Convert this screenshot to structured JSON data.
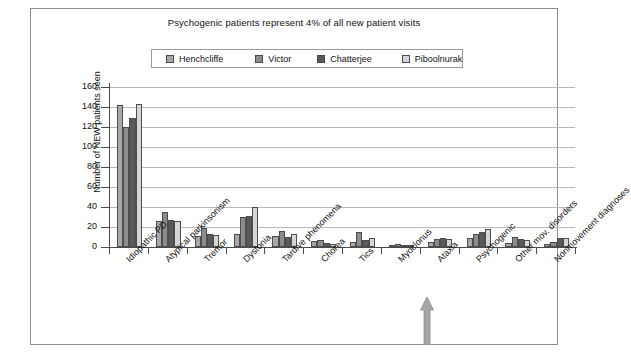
{
  "chart_data": {
    "type": "bar",
    "title": "Psychogenic patients represent 4% of all new patient visits",
    "xlabel": "",
    "ylabel": "Number of NEW patients seen",
    "ylim": [
      0,
      160
    ],
    "yticks": [
      0,
      20,
      40,
      60,
      80,
      100,
      120,
      140,
      160
    ],
    "grid": true,
    "legend_position": "top-center",
    "categories": [
      "Idiopathic PD",
      "Atypical parkinsonism",
      "Tremor",
      "Dystonia",
      "Tardive phenomena",
      "Chorea",
      "Tics",
      "Myoclonus",
      "Ataxia",
      "Psychogenic",
      "Other mov. disorders",
      "Nonmovement diagnoses"
    ],
    "series": [
      {
        "name": "Henchcliffe",
        "color": "#a8a8a8",
        "values": [
          142,
          26,
          11,
          13,
          11,
          6,
          5,
          2,
          5,
          9,
          4,
          3
        ]
      },
      {
        "name": "Victor",
        "color": "#8c8c8c",
        "values": [
          120,
          35,
          19,
          30,
          16,
          7,
          15,
          3,
          8,
          13,
          10,
          5
        ]
      },
      {
        "name": "Chatterjee",
        "color": "#5a5a5a",
        "values": [
          129,
          27,
          13,
          31,
          10,
          4,
          7,
          2,
          9,
          15,
          8,
          9
        ]
      },
      {
        "name": "Piboolnurak",
        "color": "#d6d6d6",
        "values": [
          143,
          26,
          12,
          40,
          13,
          3,
          9,
          2,
          8,
          18,
          7,
          9
        ]
      }
    ],
    "annotation": {
      "name": "arrow-psychogenic",
      "points_to": "Psychogenic",
      "color": "#9a9a9a"
    }
  },
  "legend": {
    "items": [
      {
        "label": "Henchcliffe"
      },
      {
        "label": "Victor"
      },
      {
        "label": "Chatterjee"
      },
      {
        "label": "Piboolnurak"
      }
    ]
  }
}
